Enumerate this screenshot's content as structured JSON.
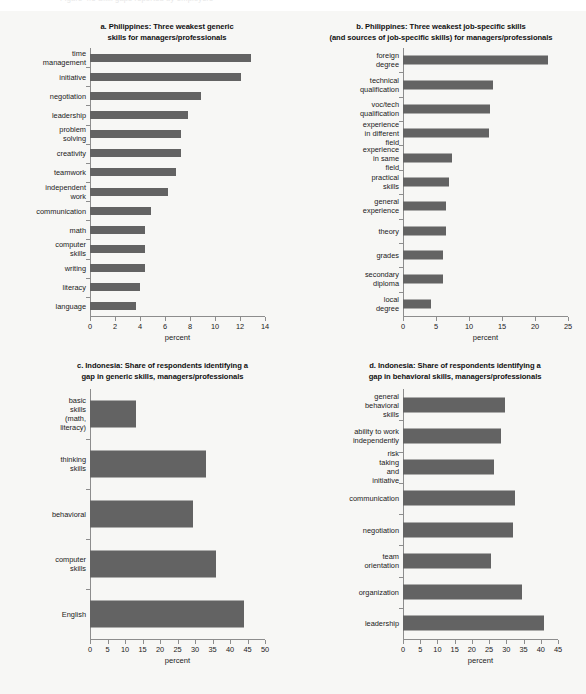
{
  "figure": {
    "background_color": "#f7f7f5",
    "bar_color": "#636363",
    "axis_color": "#8d8d8d",
    "cut_off_header": "Figure 4.5  Skill gaps reported by employers"
  },
  "chart_data": [
    {
      "id": "a",
      "type": "bar",
      "orientation": "horizontal",
      "title": "a. Philippines: Three weakest generic\nskills for managers/professionals",
      "title_line1": "a. Philippines: Three weakest generic",
      "title_line2": "skills for managers/professionals",
      "xlabel": "percent",
      "ylabel": "",
      "xlim": [
        0,
        14
      ],
      "xticks": [
        0,
        2,
        4,
        6,
        8,
        10,
        12,
        14
      ],
      "grid": false,
      "legend": "none",
      "categories": [
        "time management",
        "initiative",
        "negotiation",
        "leadership",
        "problem solving",
        "creativity",
        "teamwork",
        "independent work",
        "communication",
        "math",
        "computer skills",
        "writing",
        "literacy",
        "language"
      ],
      "values": [
        12.9,
        12.1,
        8.9,
        7.8,
        7.3,
        7.3,
        6.9,
        6.2,
        4.9,
        4.4,
        4.4,
        4.4,
        4.0,
        3.7
      ]
    },
    {
      "id": "b",
      "type": "bar",
      "orientation": "horizontal",
      "title": "b. Philippines: Three weakest job-specific skills\n(and sources of job-specific skills) for managers/professionals",
      "title_line1": "b. Philippines: Three weakest job-specific skills",
      "title_line2": "(and sources of job-specific skills) for managers/professionals",
      "xlabel": "percent",
      "ylabel": "",
      "xlim": [
        0,
        25
      ],
      "xticks": [
        0,
        5,
        10,
        15,
        20,
        25
      ],
      "grid": false,
      "legend": "none",
      "categories": [
        "foreign degree",
        "technical qualification",
        "voc/tech qualification",
        "experience in different field",
        "experience in same field",
        "practical skills",
        "general experience",
        "theory",
        "grades",
        "secondary diploma",
        "local degree"
      ],
      "values": [
        22.0,
        13.6,
        13.2,
        13.0,
        7.4,
        7.0,
        6.5,
        6.5,
        6.1,
        6.1,
        4.3
      ]
    },
    {
      "id": "c",
      "type": "bar",
      "orientation": "horizontal",
      "title": "c. Indonesia: Share of respondents identifying a\ngap in generic skills, managers/professionals",
      "title_line1": "c. Indonesia: Share of respondents identifying a",
      "title_line2": "gap in generic skills, managers/professionals",
      "xlabel": "percent",
      "ylabel": "",
      "xlim": [
        0,
        50
      ],
      "xticks": [
        0,
        5,
        10,
        15,
        20,
        25,
        30,
        35,
        40,
        45,
        50
      ],
      "grid": false,
      "legend": "none",
      "categories": [
        "basic skills (math,\nliteracy)",
        "thinking skills",
        "behavioral",
        "computer skills",
        "English"
      ],
      "values": [
        13.0,
        33.0,
        29.5,
        36.0,
        44.0
      ]
    },
    {
      "id": "d",
      "type": "bar",
      "orientation": "horizontal",
      "title": "d. Indonesia: Share of respondents identifying a\ngap in behavioral skills, managers/professionals",
      "title_line1": "d. Indonesia: Share of respondents identifying a",
      "title_line2": "gap in behavioral skills, managers/professionals",
      "xlabel": "percent",
      "ylabel": "",
      "xlim": [
        0,
        45
      ],
      "xticks": [
        0,
        5,
        10,
        15,
        20,
        25,
        30,
        35,
        40,
        45
      ],
      "grid": false,
      "legend": "none",
      "categories": [
        "general behavioral skills",
        "ability to work independently",
        "risk taking and initiative",
        "communication",
        "negotiation",
        "team orientation",
        "organization",
        "leadership"
      ],
      "values": [
        29.5,
        28.5,
        26.5,
        32.5,
        32.0,
        25.5,
        34.5,
        41.0
      ]
    }
  ]
}
